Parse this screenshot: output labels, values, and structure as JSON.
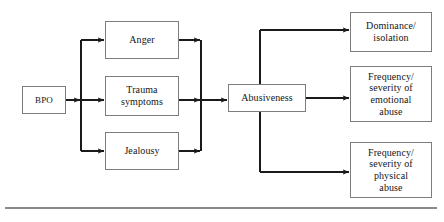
{
  "diagram": {
    "type": "flow-diagram",
    "background_color": "#ffffff",
    "box_border_color": "#7d7d7d",
    "line_color": "#1a1a1a",
    "text_color": "#151515",
    "rule_color": "#8a8a8a",
    "nodes": [
      {
        "id": "bpo",
        "label": "BPO",
        "column": "predictor"
      },
      {
        "id": "anger",
        "label": "Anger",
        "column": "mediator"
      },
      {
        "id": "trauma",
        "label": "Trauma\nsymptoms",
        "column": "mediator"
      },
      {
        "id": "jealousy",
        "label": "Jealousy",
        "column": "mediator"
      },
      {
        "id": "abusiveness",
        "label": "Abusiveness",
        "column": "latent"
      },
      {
        "id": "dominance",
        "label": "Dominance/\nisolation",
        "column": "outcome"
      },
      {
        "id": "emotional",
        "label": "Frequency/\nseverity of\nemotional\nabuse",
        "column": "outcome"
      },
      {
        "id": "physical",
        "label": "Frequency/\nseverity of\nphysical\nabuse",
        "column": "outcome"
      }
    ],
    "edges": [
      {
        "from": "bpo",
        "to": "anger"
      },
      {
        "from": "bpo",
        "to": "trauma"
      },
      {
        "from": "bpo",
        "to": "jealousy"
      },
      {
        "from": "anger",
        "to": "abusiveness"
      },
      {
        "from": "trauma",
        "to": "abusiveness"
      },
      {
        "from": "jealousy",
        "to": "abusiveness"
      },
      {
        "from": "abusiveness",
        "to": "dominance"
      },
      {
        "from": "abusiveness",
        "to": "emotional"
      },
      {
        "from": "abusiveness",
        "to": "physical"
      }
    ]
  }
}
